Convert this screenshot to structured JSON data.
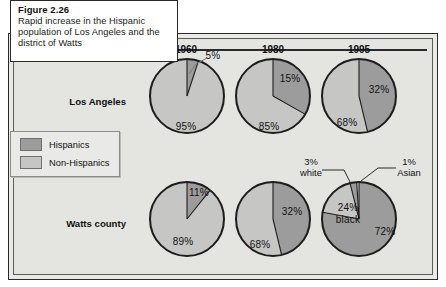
{
  "figure": {
    "caption_title": "Figure 2.26",
    "caption_text": "Rapid increase in the Hispanic population of Los Angeles and the district of Watts"
  },
  "legend": {
    "items": [
      {
        "label": "Hispanics",
        "color": "#9c9c9c"
      },
      {
        "label": "Non-Hispanics",
        "color": "#c6c6c4"
      }
    ]
  },
  "columns": [
    {
      "year": "1960"
    },
    {
      "year": "1980"
    },
    {
      "year": "1995"
    }
  ],
  "rows": [
    {
      "label": "Los Angeles"
    },
    {
      "label": "Watts county"
    }
  ],
  "labels": {
    "la_1960_hispanic": "5%",
    "la_1960_non": "95%",
    "la_1980_hispanic": "15%",
    "la_1980_non": "85%",
    "la_1995_hispanic": "32%",
    "la_1995_non": "68%",
    "watts_1960_hispanic": "11%",
    "watts_1960_non": "89%",
    "watts_1980_hispanic": "32%",
    "watts_1980_non": "68%",
    "watts_1995_hispanic": "72%",
    "watts_1995_black": "24%\nblack",
    "watts_1995_white_pct": "3%",
    "watts_1995_white_name": "white",
    "watts_1995_asian_pct": "1%",
    "watts_1995_asian_name": "Asian"
  },
  "chart_data": {
    "type": "pie",
    "title": "Rapid increase in the Hispanic population of Los Angeles and the district of Watts",
    "legend_position": "left-middle",
    "colors": {
      "hispanic": "#9c9c9c",
      "non_hispanic": "#c6c6c4",
      "black": "#c6c6c4",
      "white": "#9c9c9c",
      "asian": "#e4e4e1"
    },
    "row_categories": [
      "Los Angeles",
      "Watts county"
    ],
    "column_categories": [
      "1960",
      "1980",
      "1995"
    ],
    "pies": [
      {
        "row": "Los Angeles",
        "year": "1960",
        "slices": [
          {
            "name": "Hispanics",
            "value": 5,
            "label": "5%"
          },
          {
            "name": "Non-Hispanics",
            "value": 95,
            "label": "95%"
          }
        ]
      },
      {
        "row": "Los Angeles",
        "year": "1980",
        "slices": [
          {
            "name": "Hispanics",
            "value": 15,
            "label": "15%"
          },
          {
            "name": "Non-Hispanics",
            "value": 85,
            "label": "85%"
          }
        ]
      },
      {
        "row": "Los Angeles",
        "year": "1995",
        "slices": [
          {
            "name": "Hispanics",
            "value": 32,
            "label": "32%"
          },
          {
            "name": "Non-Hispanics",
            "value": 68,
            "label": "68%"
          }
        ]
      },
      {
        "row": "Watts county",
        "year": "1960",
        "slices": [
          {
            "name": "Hispanics",
            "value": 11,
            "label": "11%"
          },
          {
            "name": "Non-Hispanics",
            "value": 89,
            "label": "89%"
          }
        ]
      },
      {
        "row": "Watts county",
        "year": "1980",
        "slices": [
          {
            "name": "Hispanics",
            "value": 32,
            "label": "32%"
          },
          {
            "name": "Non-Hispanics",
            "value": 68,
            "label": "68%"
          }
        ]
      },
      {
        "row": "Watts county",
        "year": "1995",
        "slices": [
          {
            "name": "Hispanics",
            "value": 72,
            "label": "72%"
          },
          {
            "name": "black",
            "value": 24,
            "label": "24% black"
          },
          {
            "name": "white",
            "value": 3,
            "label": "3% white"
          },
          {
            "name": "Asian",
            "value": 1,
            "label": "1% Asian"
          }
        ]
      }
    ]
  }
}
